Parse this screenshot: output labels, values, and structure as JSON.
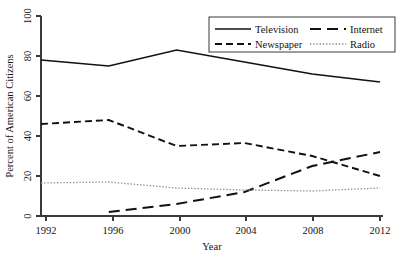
{
  "chart_data": {
    "type": "line",
    "title": "",
    "xlabel": "Year",
    "ylabel": "Percent of American Citizens",
    "x": [
      1992,
      1996,
      2000,
      2004,
      2008,
      2012
    ],
    "xticklabels": [
      "1992",
      "1996",
      "2000",
      "2004",
      "2008",
      "2012"
    ],
    "yticks": [
      0,
      20,
      40,
      60,
      80,
      100
    ],
    "yticklabels": [
      "0",
      "20",
      "40",
      "60",
      "80",
      "100"
    ],
    "xlim": [
      1992,
      2012
    ],
    "ylim": [
      0,
      100
    ],
    "grid": false,
    "legend_position": "top-right",
    "series": [
      {
        "name": "Television",
        "style": "solid",
        "color": "#111111",
        "values": [
          78,
          75,
          83,
          77,
          71,
          67
        ]
      },
      {
        "name": "Internet",
        "style": "long-dash",
        "color": "#111111",
        "values": [
          null,
          2,
          6,
          12,
          25,
          32
        ]
      },
      {
        "name": "Newspaper",
        "style": "dashed",
        "color": "#111111",
        "values": [
          46,
          48,
          35,
          36.5,
          30,
          20
        ]
      },
      {
        "name": "Radio",
        "style": "dotted",
        "color": "#8d8d8d",
        "values": [
          16.5,
          17,
          14,
          13,
          12.5,
          14
        ]
      }
    ],
    "legend_entries": [
      "Television",
      "Internet",
      "Newspaper",
      "Radio"
    ]
  }
}
